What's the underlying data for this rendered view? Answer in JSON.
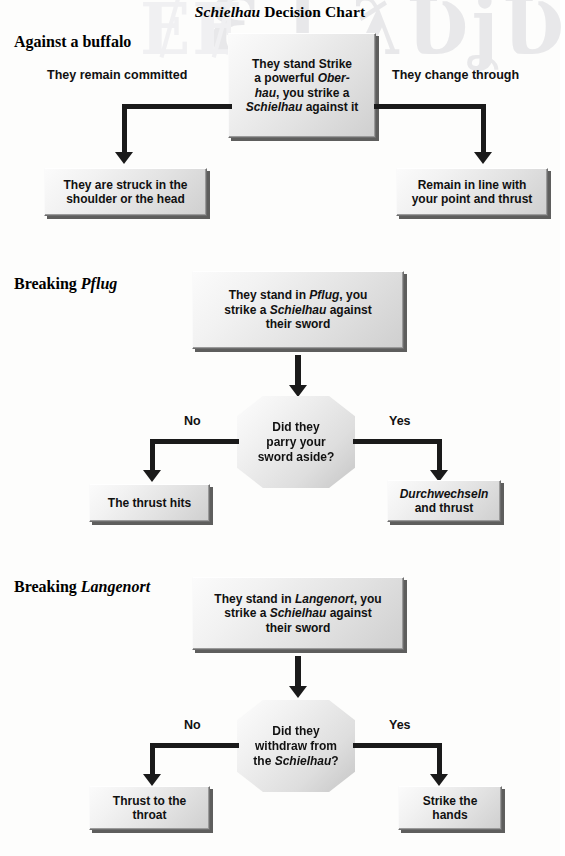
{
  "chart": {
    "title_italic": "Schielhau",
    "title_rest": " Decision Chart",
    "watermark_right": "Ԑ ʈ ƛƲʝƲ",
    "watermark_left": "ɆɆ"
  },
  "sections": [
    {
      "id": "against-a-buffalo",
      "heading_plain": "Against a buffalo",
      "heading_italic": "",
      "start_box": {
        "line1": "They stand Strike",
        "line2_pre": "a powerful ",
        "line2_italic": "Ober-",
        "line3_italic": "hau",
        "line3_post": ", you strike a",
        "line4_italic": "Schielhau",
        "line4_post": " against it"
      },
      "left_label": "They remain committed",
      "right_label": "They change through",
      "left_outcome": {
        "line1": "They are struck in the",
        "line2": "shoulder or the head"
      },
      "right_outcome": {
        "line1": "Remain in line with",
        "line2": "your point and thrust"
      }
    },
    {
      "id": "breaking-pflug",
      "heading_plain": "Breaking ",
      "heading_italic": "Pflug",
      "start_box": {
        "line1_pre": "They stand in ",
        "line1_italic": "Pflug",
        "line1_post": ", you",
        "line2_pre": "strike a ",
        "line2_italic": "Schielhau",
        "line2_post": " against",
        "line3": "their sword"
      },
      "decision": {
        "line1": "Did they",
        "line2": "parry your",
        "line3": "sword aside?"
      },
      "left_label": "No",
      "right_label": "Yes",
      "left_outcome": {
        "line1": "The thrust hits"
      },
      "right_outcome": {
        "line1_italic": "Durchwechseln",
        "line2": "and  thrust"
      }
    },
    {
      "id": "breaking-langenort",
      "heading_plain": "Breaking ",
      "heading_italic": "Langenort",
      "start_box": {
        "line1_pre": "They stand in ",
        "line1_italic": "Langenort",
        "line1_post": ", you",
        "line2_pre": "strike a ",
        "line2_italic": "Schielhau",
        "line2_post": " against",
        "line3": "their sword"
      },
      "decision": {
        "line1": "Did they",
        "line2": "withdraw from",
        "line3_pre": "the ",
        "line3_italic": "Schielhau",
        "line3_post": "?"
      },
      "left_label": "No",
      "right_label": "Yes",
      "left_outcome": {
        "line1": "Thrust to the",
        "line2": "throat"
      },
      "right_outcome": {
        "line1": "Strike the",
        "line2": "hands"
      }
    }
  ],
  "colors": {
    "box_fill_light": "#fbfbfb",
    "box_fill_dark": "#cfcfcf",
    "box_border": "#6e6e6e",
    "connector": "#1a1a1a",
    "text": "#111111",
    "watermark": "#e8e8ea"
  }
}
